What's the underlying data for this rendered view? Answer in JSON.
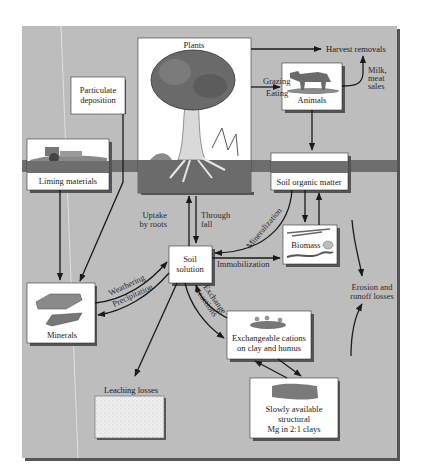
{
  "diagram": {
    "colors": {
      "page_background": "#ffffff",
      "panel_background": "#bdbdbd",
      "panel_shadow": "#555555",
      "box_fill": "#ffffff",
      "arrow": "#1a1a1a",
      "soil_band": "#6e6e6e"
    },
    "nodes": {
      "plants": "Plants",
      "harvest_removals": "Harvest removals",
      "animals": "Animals",
      "milk_meat_sales": [
        "Milk,",
        "meat",
        "sales"
      ],
      "particulate_deposition": [
        "Particulate",
        "deposition"
      ],
      "liming_materials": "Liming materials",
      "soil_organic_matter": "Soil organic matter",
      "biomass": "Biomass",
      "soil_solution": [
        "Soil",
        "solution"
      ],
      "minerals": "Minerals",
      "exchangeable_cations": [
        "Exchangeable cations",
        "on clay and humus"
      ],
      "leaching_losses": "Leaching losses",
      "slowly_available": [
        "Slowly available",
        "structural",
        "Mg in 2:1 clays"
      ],
      "erosion": [
        "Erosion and",
        "runoff losses"
      ]
    },
    "flows": {
      "grazing": "Grazing",
      "eating": "Eating",
      "uptake": [
        "Uptake",
        "by roots"
      ],
      "through_fall": [
        "Through",
        "fall"
      ],
      "mineralization": "Mineralization",
      "immobilization": "Immobilization",
      "weathering": "Weathering",
      "precipitation": "Precipitation",
      "exchange_reactions": [
        "Exchange",
        "reactions"
      ]
    }
  }
}
